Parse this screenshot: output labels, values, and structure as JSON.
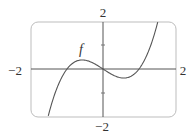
{
  "chart_data": {
    "type": "line",
    "title": "",
    "function_label": "f",
    "xlabel": "",
    "ylabel": "",
    "xlim": [
      -2,
      2
    ],
    "ylim": [
      -2,
      2
    ],
    "tick_labels": {
      "x_min": "−2",
      "x_max": "2",
      "y_min": "−2",
      "y_max": "2"
    },
    "y_ticks": [
      -1,
      1
    ],
    "grid": false,
    "series": [
      {
        "name": "f",
        "x": [
          -1.5,
          -1.25,
          -1.0,
          -0.75,
          -0.577,
          -0.5,
          -0.25,
          0,
          0.25,
          0.5,
          0.577,
          0.75,
          1.0,
          1.25,
          1.5
        ],
        "values": [
          -1.875,
          -0.703,
          0,
          0.328,
          0.385,
          0.375,
          0.234,
          0,
          -0.234,
          -0.375,
          -0.385,
          -0.328,
          0,
          0.703,
          1.875
        ]
      }
    ],
    "colors": {
      "curve": "#555555",
      "axes": "#555555",
      "frame": "#bbbbbb"
    }
  }
}
